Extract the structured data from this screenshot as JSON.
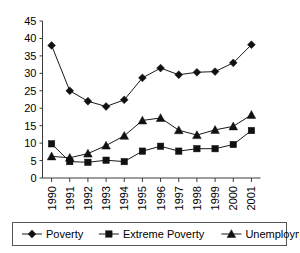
{
  "chart_data": {
    "type": "line",
    "title": "",
    "subtitle": "",
    "xlabel": "",
    "ylabel": "",
    "categories": [
      "1990",
      "1991",
      "1992",
      "1993",
      "1994",
      "1995",
      "1996",
      "1997",
      "1998",
      "1999",
      "2000",
      "2001"
    ],
    "ylim": [
      0,
      45
    ],
    "yticks": [
      0,
      5,
      10,
      15,
      20,
      25,
      30,
      35,
      40,
      45
    ],
    "ytick_labels": [
      "0",
      "5",
      "10",
      "15",
      "20",
      "25",
      "30",
      "35",
      "40",
      "45"
    ],
    "grid": false,
    "legend_position": "bottom",
    "series": [
      {
        "name": "Poverty",
        "marker": "diamond",
        "values": [
          38.0,
          25.0,
          22.0,
          20.5,
          22.4,
          28.7,
          31.5,
          29.6,
          30.3,
          30.5,
          33.0,
          38.2
        ]
      },
      {
        "name": "Extreme Poverty",
        "marker": "square",
        "values": [
          9.8,
          4.7,
          4.5,
          5.1,
          4.7,
          7.7,
          9.1,
          7.7,
          8.4,
          8.4,
          9.6,
          13.6
        ]
      },
      {
        "name": "Unemployment",
        "marker": "triangle",
        "values": [
          6.2,
          5.8,
          7.0,
          9.3,
          12.1,
          16.5,
          17.2,
          13.7,
          12.3,
          13.8,
          14.8,
          18.1
        ]
      }
    ],
    "colors": {
      "line": "#1a1a1a",
      "marker": "#111111",
      "axis": "#3a3a3a",
      "background": "#ffffff",
      "legend_border": "#555555"
    }
  },
  "legend": {
    "items": [
      {
        "label": "Poverty",
        "marker": "diamond"
      },
      {
        "label": "Extreme Poverty",
        "marker": "square"
      },
      {
        "label": "Unemployment",
        "marker": "triangle"
      }
    ]
  }
}
